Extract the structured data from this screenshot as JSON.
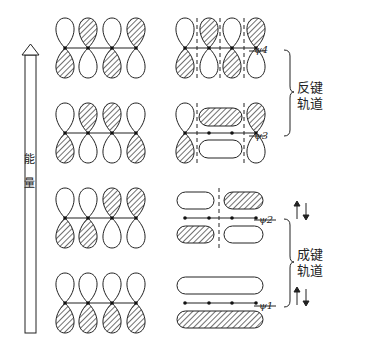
{
  "energy_axis": {
    "label_line1": "能",
    "label_line2": "量"
  },
  "orbitals": [
    {
      "name": "ψ4",
      "label": "ψ4",
      "type": "antibonding",
      "signs": [
        1,
        -1,
        1,
        -1
      ]
    },
    {
      "name": "ψ3",
      "label": "ψ3",
      "type": "antibonding",
      "signs": [
        1,
        -1,
        -1,
        1
      ]
    },
    {
      "name": "ψ2",
      "label": "ψ2",
      "type": "bonding",
      "signs": [
        1,
        1,
        -1,
        -1
      ]
    },
    {
      "name": "ψ1",
      "label": "ψ1",
      "type": "bonding",
      "signs": [
        1,
        1,
        1,
        1
      ]
    }
  ],
  "groups": {
    "antibonding": {
      "line1": "反键",
      "line2": "轨道"
    },
    "bonding": {
      "line1": "成键",
      "line2": "轨道"
    }
  },
  "colors": {
    "stroke": "#222222",
    "hatch": "#333333"
  }
}
